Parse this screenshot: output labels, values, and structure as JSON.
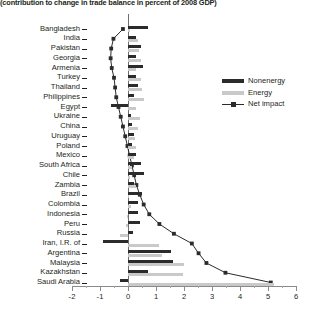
{
  "chart_data": {
    "type": "bar",
    "title": "(contribution to change in trade balance in percent of 2008 GDP)",
    "xlabel": "",
    "ylabel": "",
    "xlim": [
      -2,
      6
    ],
    "xticks": [
      -2,
      -1,
      0,
      1,
      2,
      3,
      4,
      5,
      6
    ],
    "xtick_labels": [
      "-2",
      "-1",
      "0",
      "1",
      "2",
      "3",
      "4",
      "5",
      "6"
    ],
    "grid": false,
    "orientation": "horizontal",
    "legend_position": "right",
    "categories": [
      "Bangladesh",
      "India",
      "Pakistan",
      "Georgia",
      "Armenia",
      "Turkey",
      "Thailand",
      "Philippines",
      "Egypt",
      "Ukraine",
      "China",
      "Uruguay",
      "Poland",
      "Mexico",
      "South Africa",
      "Chile",
      "Zambia",
      "Brazil",
      "Colombia",
      "Indonesia",
      "Peru",
      "Russia",
      "Iran, I.R. of",
      "Argentina",
      "Malaysia",
      "Kazakhstan",
      "Saudi Arabia"
    ],
    "series": [
      {
        "name": "Nonenergy",
        "color": "#2b2b2b",
        "values": [
          0.72,
          0.3,
          0.46,
          0.28,
          0.52,
          0.3,
          0.36,
          0.22,
          -0.62,
          0.12,
          0.16,
          0.22,
          0.14,
          0.3,
          0.46,
          0.58,
          0.22,
          0.5,
          0.34,
          0.36,
          0.42,
          0.18,
          -0.9,
          1.55,
          1.6,
          0.72,
          -0.28
        ]
      },
      {
        "name": "Energy",
        "color": "#c9c9c9",
        "values": [
          0.06,
          0.34,
          0.4,
          0.46,
          0.3,
          0.46,
          0.5,
          0.56,
          0.3,
          0.44,
          0.34,
          0.26,
          0.3,
          0.22,
          0.14,
          0.08,
          0.3,
          0.04,
          0.1,
          -0.02,
          -0.06,
          -0.3,
          1.1,
          1.2,
          2.0,
          1.95,
          5.2
        ]
      },
      {
        "name": "Net impact",
        "color": "#2b2b2b",
        "marker": "square",
        "values": [
          -0.18,
          -0.52,
          -0.6,
          -0.62,
          -0.58,
          -0.5,
          -0.46,
          -0.42,
          -0.34,
          -0.26,
          -0.18,
          -0.1,
          -0.02,
          0.06,
          0.14,
          0.22,
          0.3,
          0.42,
          0.56,
          0.76,
          1.12,
          1.64,
          2.28,
          2.52,
          2.8,
          3.48,
          5.1
        ]
      }
    ]
  },
  "legend": {
    "items": [
      {
        "label": "Nonenergy",
        "type": "swatch",
        "color": "#2b2b2b"
      },
      {
        "label": "Energy",
        "type": "swatch",
        "color": "#c9c9c9"
      },
      {
        "label": "Net impact",
        "type": "line-marker",
        "color": "#2b2b2b"
      }
    ]
  }
}
